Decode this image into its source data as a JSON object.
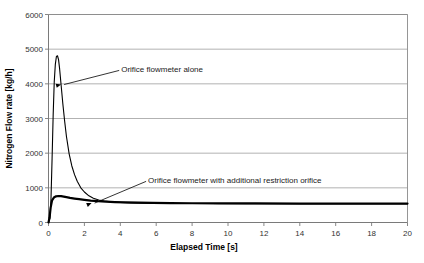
{
  "chart_data": {
    "type": "line",
    "title": "",
    "xlabel": "Elapsed Time [s]",
    "ylabel": "Nitrogen Flow rate [kg/h]",
    "xlim": [
      0,
      20
    ],
    "ylim": [
      0,
      6000
    ],
    "xticks": [
      0,
      2,
      4,
      6,
      8,
      10,
      12,
      14,
      16,
      18,
      20
    ],
    "xtick_labels": [
      "0",
      "2",
      "4",
      "6",
      "8",
      "10",
      "12",
      "14",
      "16",
      "18",
      "20"
    ],
    "yticks": [
      0,
      1000,
      2000,
      3000,
      4000,
      5000,
      6000
    ],
    "ytick_labels": [
      "0",
      "1000",
      "2000",
      "3000",
      "4000",
      "5000",
      "6000"
    ],
    "grid": "horizontal",
    "legend": "none",
    "annotations": [
      {
        "name": "orifice-alone-label",
        "text": "Orifice flowmeter alone",
        "text_x": 4.05,
        "text_y": 4430,
        "point_x": 0.7,
        "point_y": 3980
      },
      {
        "name": "orifice-with-restriction-label",
        "text": "Orifice flowmeter with additional restriction orifice",
        "text_x": 5.55,
        "text_y": 1230,
        "point_x": 2.4,
        "point_y": 560
      }
    ],
    "series": [
      {
        "name": "Orifice flowmeter alone",
        "color": "#000000",
        "line_width": 1.1,
        "points": [
          [
            0.0,
            0
          ],
          [
            0.08,
            120
          ],
          [
            0.14,
            700
          ],
          [
            0.2,
            1850
          ],
          [
            0.26,
            3100
          ],
          [
            0.32,
            4050
          ],
          [
            0.38,
            4560
          ],
          [
            0.44,
            4790
          ],
          [
            0.5,
            4810
          ],
          [
            0.56,
            4700
          ],
          [
            0.62,
            4430
          ],
          [
            0.7,
            3980
          ],
          [
            0.8,
            3420
          ],
          [
            0.9,
            2920
          ],
          [
            1.0,
            2480
          ],
          [
            1.15,
            1980
          ],
          [
            1.3,
            1630
          ],
          [
            1.45,
            1380
          ],
          [
            1.6,
            1190
          ],
          [
            1.8,
            1000
          ],
          [
            2.0,
            880
          ],
          [
            2.25,
            770
          ],
          [
            2.5,
            700
          ],
          [
            2.8,
            650
          ],
          [
            3.1,
            620
          ],
          [
            3.5,
            595
          ],
          [
            4.0,
            578
          ],
          [
            4.6,
            566
          ],
          [
            5.3,
            558
          ],
          [
            6.2,
            552
          ],
          [
            7.5,
            548
          ],
          [
            9.0,
            546
          ],
          [
            11.0,
            545
          ],
          [
            14.0,
            544
          ],
          [
            17.0,
            544
          ],
          [
            20.0,
            544
          ]
        ]
      },
      {
        "name": "Orifice flowmeter with additional restriction orifice",
        "color": "#000000",
        "line_width": 2.2,
        "points": [
          [
            0.0,
            0
          ],
          [
            0.06,
            150
          ],
          [
            0.12,
            430
          ],
          [
            0.2,
            640
          ],
          [
            0.3,
            720
          ],
          [
            0.42,
            755
          ],
          [
            0.55,
            765
          ],
          [
            0.7,
            760
          ],
          [
            0.85,
            745
          ],
          [
            1.0,
            730
          ],
          [
            1.2,
            710
          ],
          [
            1.45,
            690
          ],
          [
            1.7,
            672
          ],
          [
            2.0,
            652
          ],
          [
            2.35,
            632
          ],
          [
            2.75,
            614
          ],
          [
            3.2,
            600
          ],
          [
            3.7,
            590
          ],
          [
            4.3,
            580
          ],
          [
            5.0,
            572
          ],
          [
            5.8,
            566
          ],
          [
            6.8,
            560
          ],
          [
            8.0,
            556
          ],
          [
            9.5,
            552
          ],
          [
            11.5,
            549
          ],
          [
            14.0,
            547
          ],
          [
            17.0,
            546
          ],
          [
            20.0,
            546
          ]
        ]
      }
    ]
  }
}
